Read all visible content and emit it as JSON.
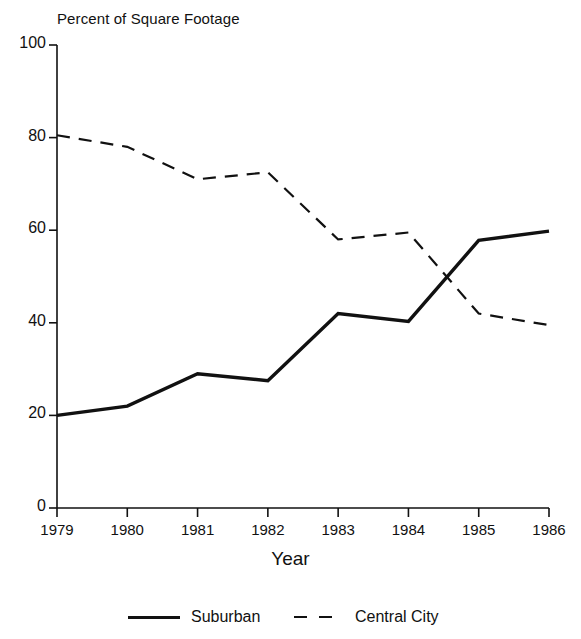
{
  "chart_data": {
    "type": "line",
    "title": "Percent of Square Footage",
    "xlabel": "Year",
    "ylabel": "",
    "x": [
      "1979",
      "1980",
      "1981",
      "1982",
      "1983",
      "1984",
      "1985",
      "1986"
    ],
    "categories": [
      "1979",
      "1980",
      "1981",
      "1982",
      "1983",
      "1984",
      "1985",
      "1986"
    ],
    "xlim": [
      1979,
      1986
    ],
    "ylim": [
      0,
      100
    ],
    "yticks": [
      0,
      20,
      40,
      60,
      80,
      100
    ],
    "ytick_labels": [
      "0",
      "20",
      "40",
      "60",
      "80",
      "100"
    ],
    "xtick_labels": [
      "1979",
      "1980",
      "1981",
      "1982",
      "1983",
      "1984",
      "1985",
      "1986"
    ],
    "grid": false,
    "legend_position": "bottom",
    "series": [
      {
        "name": "Suburban",
        "style": "solid",
        "color": "#111111",
        "values": [
          20.0,
          22.0,
          29.0,
          27.5,
          42.0,
          40.3,
          57.8,
          59.8
        ]
      },
      {
        "name": "Central City",
        "style": "dashed",
        "color": "#111111",
        "values": [
          80.5,
          78.0,
          71.0,
          72.5,
          58.0,
          59.5,
          42.0,
          39.5
        ]
      }
    ],
    "annotations": []
  },
  "legend": {
    "items": [
      {
        "label": "Suburban",
        "style": "solid"
      },
      {
        "label": "Central City",
        "style": "dashed"
      }
    ]
  },
  "axes": {
    "x_axis_name": "Year",
    "y_axis_title": "Percent of Square Footage"
  }
}
